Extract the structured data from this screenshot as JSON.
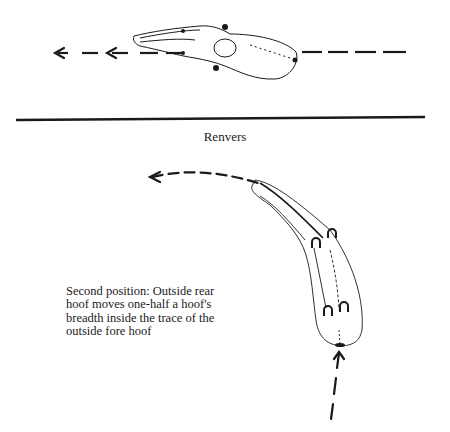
{
  "figure": {
    "section_title": "Renvers",
    "caption": "Second position: Outside rear hoof moves one-half a hoof's breadth inside the trace of the outside fore hoof",
    "top_panel": {
      "description": "Horse seen from above moving straight to the left along a dashed track line",
      "icons": [
        "horse-topview-icon",
        "direction-arrow-left-icon"
      ]
    },
    "bottom_panel": {
      "description": "Horse on a curved track in renvers, with four hoof prints marked",
      "icons": [
        "horse-topview-icon",
        "hoof-print-icon",
        "curved-arrow-icon",
        "direction-arrow-up-icon"
      ]
    },
    "colors": {
      "ink": "#1a1a1a",
      "background": "#ffffff"
    }
  }
}
